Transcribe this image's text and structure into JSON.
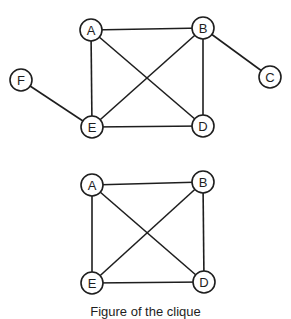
{
  "diagram": {
    "colors": {
      "stroke": "#1e1e1e",
      "background": "#ffffff"
    },
    "graphs": [
      {
        "id": "graph-top",
        "nodes": [
          {
            "id": "A",
            "label": "A",
            "x": 91,
            "y": 30
          },
          {
            "id": "B",
            "label": "B",
            "x": 203,
            "y": 28
          },
          {
            "id": "C",
            "label": "C",
            "x": 270,
            "y": 77
          },
          {
            "id": "D",
            "label": "D",
            "x": 203,
            "y": 126
          },
          {
            "id": "E",
            "label": "E",
            "x": 92,
            "y": 127
          },
          {
            "id": "F",
            "label": "F",
            "x": 21,
            "y": 80
          }
        ],
        "edges": [
          [
            "A",
            "B"
          ],
          [
            "A",
            "E"
          ],
          [
            "A",
            "D"
          ],
          [
            "B",
            "E"
          ],
          [
            "B",
            "D"
          ],
          [
            "B",
            "C"
          ],
          [
            "E",
            "D"
          ],
          [
            "F",
            "E"
          ]
        ]
      },
      {
        "id": "graph-bottom",
        "nodes": [
          {
            "id": "A",
            "label": "A",
            "x": 92,
            "y": 185
          },
          {
            "id": "B",
            "label": "B",
            "x": 203,
            "y": 182
          },
          {
            "id": "D",
            "label": "D",
            "x": 204,
            "y": 282
          },
          {
            "id": "E",
            "label": "E",
            "x": 92,
            "y": 283
          }
        ],
        "edges": [
          [
            "A",
            "B"
          ],
          [
            "A",
            "E"
          ],
          [
            "A",
            "D"
          ],
          [
            "B",
            "E"
          ],
          [
            "B",
            "D"
          ],
          [
            "E",
            "D"
          ]
        ]
      }
    ],
    "node_radius": 11,
    "caption": "Figure of the clique"
  }
}
